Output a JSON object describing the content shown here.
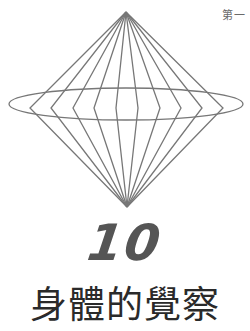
{
  "page": {
    "running_header": "第一",
    "chapter_number": "10",
    "chapter_title": "身體的覺察"
  },
  "figure": {
    "stroke_color": "#777777",
    "top_apex": [
      126,
      12
    ],
    "bottom_apex": [
      127,
      207
    ],
    "ellipse": {
      "cx": 126,
      "cy": 104,
      "rx": 117,
      "ry": 16
    },
    "kink_y": 108,
    "kink_x": [
      30,
      51,
      73,
      94,
      116,
      138,
      160,
      181,
      202,
      223
    ]
  }
}
